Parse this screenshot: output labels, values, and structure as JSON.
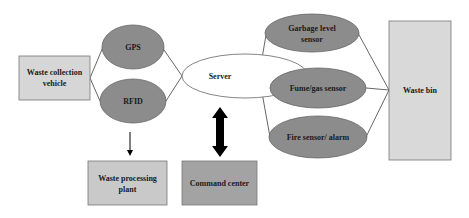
{
  "diagram": {
    "nodes": {
      "vehicle": {
        "label_line1": "Waste collection",
        "label_line2": "vehicle",
        "shape": "rect",
        "fill": "#d6d6d6"
      },
      "gps": {
        "label": "GPS",
        "shape": "ellipse",
        "fill": "#8c8c8c"
      },
      "rfid": {
        "label": "RFID",
        "shape": "ellipse",
        "fill": "#8c8c8c"
      },
      "server": {
        "label": "Server",
        "shape": "ellipse",
        "fill": "#ffffff"
      },
      "garbage_sensor": {
        "label_line1": "Garbage level",
        "label_line2": "sensor",
        "shape": "ellipse",
        "fill": "#8c8c8c"
      },
      "fume_sensor": {
        "label": "Fume/gas sensor",
        "shape": "ellipse",
        "fill": "#8c8c8c"
      },
      "fire_sensor": {
        "label": "Fire sensor/ alarm",
        "shape": "ellipse",
        "fill": "#8c8c8c"
      },
      "waste_bin": {
        "label": "Waste bin",
        "shape": "rect",
        "fill": "#d9d9d9"
      },
      "processing_plant": {
        "label_line1": "Waste processing",
        "label_line2": "plant",
        "shape": "rect",
        "fill": "#c9c9c9"
      },
      "command_center": {
        "label": "Command center",
        "shape": "rect",
        "fill": "#a3a3a3"
      }
    },
    "edges": [
      {
        "from": "vehicle",
        "to": "gps",
        "type": "line"
      },
      {
        "from": "vehicle",
        "to": "rfid",
        "type": "line"
      },
      {
        "from": "gps",
        "to": "server",
        "type": "line"
      },
      {
        "from": "rfid",
        "to": "server",
        "type": "line"
      },
      {
        "from": "server",
        "to": "garbage_sensor",
        "type": "line"
      },
      {
        "from": "server",
        "to": "fume_sensor",
        "type": "line"
      },
      {
        "from": "server",
        "to": "fire_sensor",
        "type": "line"
      },
      {
        "from": "garbage_sensor",
        "to": "waste_bin",
        "type": "line"
      },
      {
        "from": "fume_sensor",
        "to": "waste_bin",
        "type": "line"
      },
      {
        "from": "fire_sensor",
        "to": "waste_bin",
        "type": "line"
      },
      {
        "from": "rfid",
        "to": "processing_plant",
        "type": "arrow"
      },
      {
        "from": "server",
        "to": "command_center",
        "type": "double-arrow"
      }
    ],
    "colors": {
      "stroke": "#555555",
      "text": "#1a1a1a",
      "arrow": "#000000"
    }
  }
}
